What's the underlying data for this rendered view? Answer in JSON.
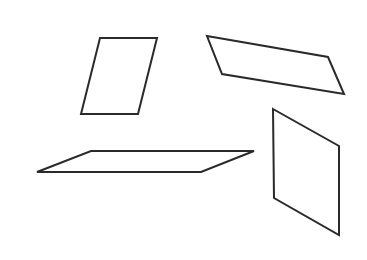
{
  "figure": {
    "background": "#ffffff",
    "stroke_color": "#2a2a2a",
    "shapes": [
      {
        "name": "parallelogram-upper-left",
        "type": "parallelogram",
        "points": "100,38 157,38 138,114 81,114"
      },
      {
        "name": "parallelogram-upper-right",
        "type": "parallelogram",
        "points": "207,36 328,57 344,94 222,74"
      },
      {
        "name": "parallelogram-lower-left",
        "type": "parallelogram",
        "points": "91,151 254,151 201,172 37,172"
      },
      {
        "name": "parallelogram-lower-right",
        "type": "parallelogram",
        "points": "273,109 339,146 339,235 274,198"
      }
    ]
  }
}
